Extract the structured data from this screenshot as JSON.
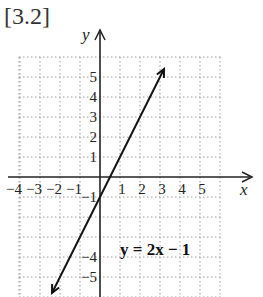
{
  "figure_label": "[3.2]",
  "equation_label": "y = 2x − 1",
  "chart_data": {
    "type": "line",
    "title": "[3.2]",
    "xlabel": "x",
    "ylabel": "y",
    "x_ticks": [
      -4,
      -3,
      -2,
      -1,
      1,
      2,
      3,
      4,
      5
    ],
    "y_ticks": [
      5,
      4,
      3,
      2,
      1,
      -1,
      -4,
      -5
    ],
    "xlim": [
      -5,
      6
    ],
    "ylim": [
      -6,
      6
    ],
    "grid": true,
    "series": [
      {
        "name": "y = 2x − 1",
        "slope": 2,
        "intercept": -1,
        "x": [
          -2.4,
          3.2
        ],
        "y": [
          -5.8,
          5.4
        ]
      }
    ],
    "annotations": [
      {
        "text": "y = 2x − 1",
        "x": 1.3,
        "y": -3.6
      }
    ]
  },
  "colors": {
    "line": "#111111",
    "grid": "#9a9a9a",
    "axis": "#222222"
  }
}
